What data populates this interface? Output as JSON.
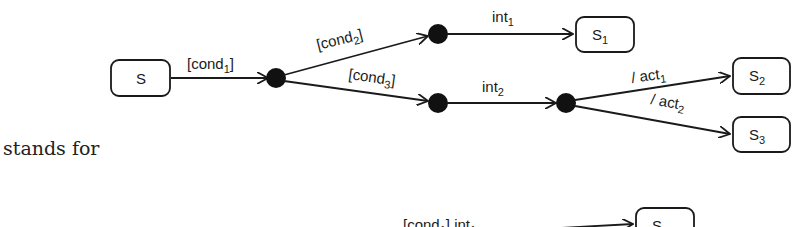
{
  "diagram": {
    "states": {
      "s": {
        "label": "S",
        "sub": ""
      },
      "s1": {
        "label": "S",
        "sub": "1"
      },
      "s2": {
        "label": "S",
        "sub": "2"
      },
      "s3": {
        "label": "S",
        "sub": "3"
      }
    },
    "transitions": {
      "cond1": {
        "pre": "[cond",
        "sub": "1",
        "post": "]"
      },
      "cond2": {
        "pre": "[cond",
        "sub": "2",
        "post": "]"
      },
      "cond3": {
        "pre": "[cond",
        "sub": "3",
        "post": "]"
      },
      "int1": {
        "pre": "int",
        "sub": "1",
        "post": ""
      },
      "int2": {
        "pre": "int",
        "sub": "2",
        "post": ""
      },
      "act1": {
        "pre": "/ act",
        "sub": "1",
        "post": ""
      },
      "act2": {
        "pre": "/ act",
        "sub": "2",
        "post": ""
      }
    },
    "bottom": {
      "label_pre": "[cond",
      "label_sub": "1",
      "label_mid": "] int",
      "label_sub2": "1",
      "state_label": "S",
      "state_sub": "1"
    }
  },
  "text": {
    "stands_for": "stands for"
  },
  "colors": {
    "stroke": "#1a1a1a",
    "junction": "#111111",
    "background": "#ffffff"
  }
}
